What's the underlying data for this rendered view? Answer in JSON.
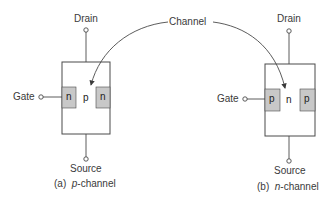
{
  "figure": {
    "channel_label": "Channel",
    "colors": {
      "line": "#4a4a4a",
      "region_fill": "#c8c8c8",
      "background": "#ffffff"
    },
    "devices": [
      {
        "id": "a",
        "drain_label": "Drain",
        "gate_label": "Gate",
        "source_label": "Source",
        "left_region": "n",
        "center_region": "p",
        "right_region": "n",
        "caption_prefix": "(a)",
        "caption_type": "p",
        "caption_suffix": "-channel"
      },
      {
        "id": "b",
        "drain_label": "Drain",
        "gate_label": "Gate",
        "source_label": "Source",
        "left_region": "p",
        "center_region": "n",
        "right_region": "p",
        "caption_prefix": "(b)",
        "caption_type": "n",
        "caption_suffix": "-channel"
      }
    ]
  }
}
